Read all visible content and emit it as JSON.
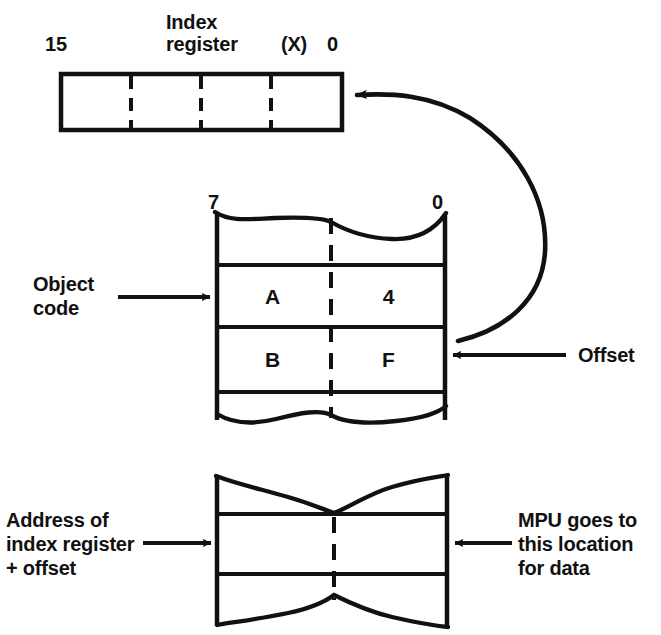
{
  "diagram": {
    "ink_color": "#111111",
    "background_color": "#ffffff"
  },
  "index_register": {
    "name_line1": "Index",
    "name_line2": "register",
    "abbrev": "(X)",
    "msb_label": "15",
    "lsb_label": "0",
    "cells": [
      "",
      "",
      "",
      ""
    ]
  },
  "object_code": {
    "label_line1": "Object",
    "label_line2": "code",
    "msb_label": "7",
    "lsb_label": "0",
    "rows": [
      {
        "high_nibble": "A",
        "low_nibble": "4"
      },
      {
        "high_nibble": "B",
        "low_nibble": "F"
      }
    ]
  },
  "offset": {
    "label": "Offset"
  },
  "memory_block": {
    "left_label_line1": "Address of",
    "left_label_line2": "index register",
    "left_label_line3": "+ offset",
    "right_label_line1": "MPU goes to",
    "right_label_line2": "this location",
    "right_label_line3": "for data"
  }
}
